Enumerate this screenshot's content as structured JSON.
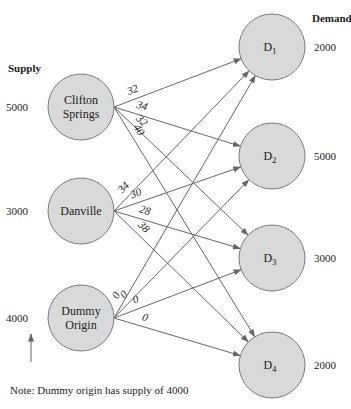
{
  "headers": {
    "supply": "Supply",
    "demand": "Demand"
  },
  "sources": [
    {
      "id": "clifton",
      "lines": [
        "Clifton",
        "Springs"
      ],
      "supply": "5000",
      "cx": 81,
      "cy": 107
    },
    {
      "id": "danville",
      "lines": [
        "Danville"
      ],
      "supply": "3000",
      "cx": 81,
      "cy": 211
    },
    {
      "id": "dummy",
      "lines": [
        "Dummy",
        "Origin"
      ],
      "supply": "4000",
      "cx": 81,
      "cy": 318
    }
  ],
  "destinations": [
    {
      "id": "d1",
      "label": "D",
      "sub": "1",
      "demand": "2000",
      "cx": 272,
      "cy": 47
    },
    {
      "id": "d2",
      "label": "D",
      "sub": "2",
      "demand": "5000",
      "cx": 272,
      "cy": 156
    },
    {
      "id": "d3",
      "label": "D",
      "sub": "3",
      "demand": "3000",
      "cx": 272,
      "cy": 258
    },
    {
      "id": "d4",
      "label": "D",
      "sub": "4",
      "demand": "2000",
      "cx": 272,
      "cy": 365
    }
  ],
  "edges": [
    {
      "from": "clifton",
      "to": "d1",
      "cost": "32"
    },
    {
      "from": "clifton",
      "to": "d2",
      "cost": "34"
    },
    {
      "from": "clifton",
      "to": "d3",
      "cost": "32"
    },
    {
      "from": "clifton",
      "to": "d4",
      "cost": "40"
    },
    {
      "from": "danville",
      "to": "d1",
      "cost": "34"
    },
    {
      "from": "danville",
      "to": "d2",
      "cost": "30"
    },
    {
      "from": "danville",
      "to": "d3",
      "cost": "28"
    },
    {
      "from": "danville",
      "to": "d4",
      "cost": "38"
    },
    {
      "from": "dummy",
      "to": "d1",
      "cost": "0"
    },
    {
      "from": "dummy",
      "to": "d2",
      "cost": "0"
    },
    {
      "from": "dummy",
      "to": "d3",
      "cost": "0"
    },
    {
      "from": "dummy",
      "to": "d4",
      "cost": "0"
    }
  ],
  "note": "Note:  Dummy origin has supply of 4000",
  "colors": {
    "node_fill": "#d9d9d9",
    "node_stroke": "#7a7a7a",
    "edge": "#666666"
  }
}
